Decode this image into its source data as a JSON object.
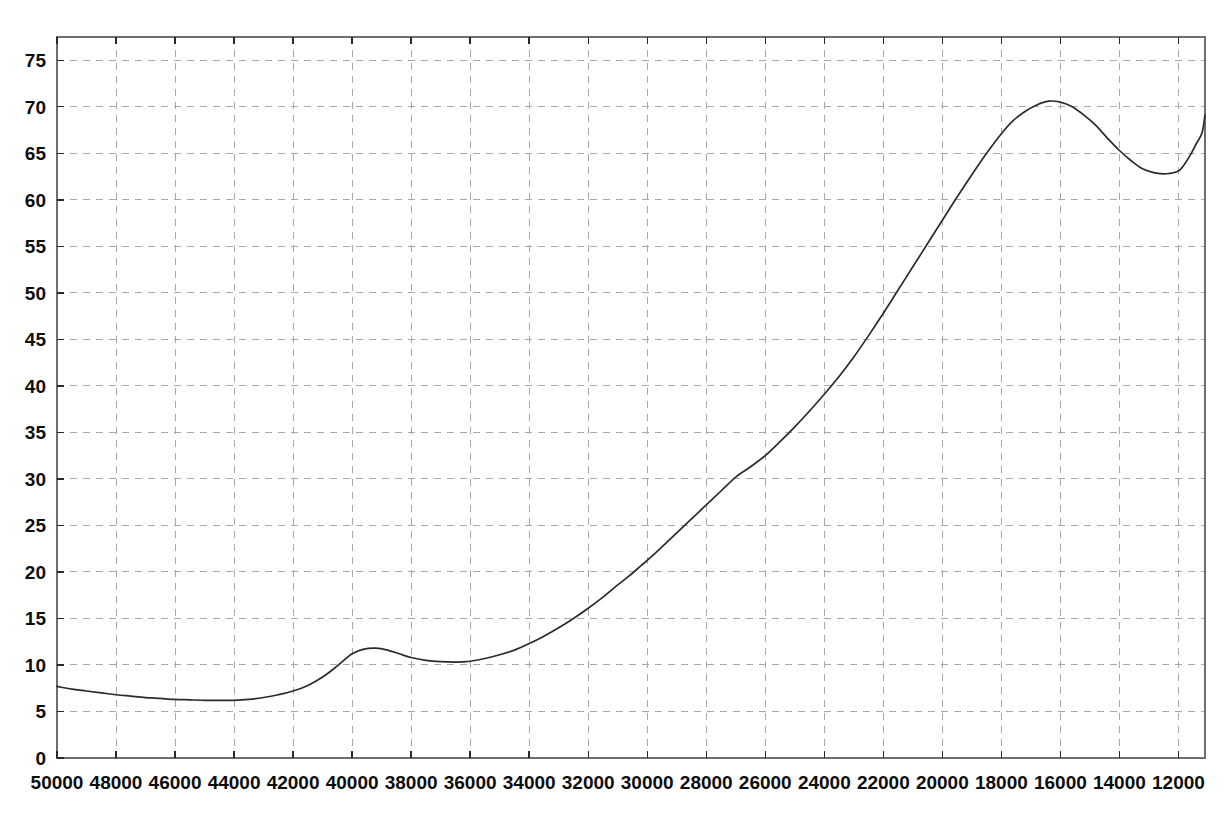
{
  "chart_data": {
    "type": "line",
    "title": "",
    "subtitle": "",
    "xlabel": "",
    "ylabel": "",
    "grid": true,
    "legend": "none",
    "x_axis_reversed": true,
    "xlim": [
      50000,
      11100
    ],
    "ylim": [
      0,
      77.5
    ],
    "x_ticks": [
      50000,
      48000,
      46000,
      44000,
      42000,
      40000,
      38000,
      36000,
      34000,
      32000,
      30000,
      28000,
      26000,
      24000,
      22000,
      20000,
      18000,
      16000,
      14000,
      12000
    ],
    "x_tick_labels": [
      "50000",
      "48000",
      "46000",
      "44000",
      "42000",
      "40000",
      "38000",
      "36000",
      "34000",
      "32000",
      "30000",
      "28000",
      "26000",
      "24000",
      "22000",
      "20000",
      "18000",
      "16000",
      "14000",
      "12000"
    ],
    "y_ticks": [
      0,
      5,
      10,
      15,
      20,
      25,
      30,
      35,
      40,
      45,
      50,
      55,
      60,
      65,
      70,
      75
    ],
    "y_tick_labels": [
      "0",
      "5",
      "10",
      "15",
      "20",
      "25",
      "30",
      "35",
      "40",
      "45",
      "50",
      "55",
      "60",
      "65",
      "70",
      "75"
    ],
    "line_color": "#2b2b2b",
    "grid_color": "#a8a8a8",
    "frame_color": "#6e6e6e",
    "background_color": "#ffffff",
    "series": [
      {
        "name": "curve",
        "x": [
          50000,
          49500,
          49000,
          48500,
          48000,
          47500,
          47000,
          46500,
          46000,
          45500,
          45000,
          44500,
          44000,
          43500,
          43000,
          42500,
          42000,
          41500,
          41000,
          40500,
          40000,
          39600,
          39200,
          38800,
          38400,
          38000,
          37500,
          37000,
          36500,
          36000,
          35500,
          35000,
          34500,
          34000,
          33500,
          33000,
          32500,
          32000,
          31500,
          31000,
          30600,
          30200,
          29800,
          29400,
          29000,
          28500,
          28000,
          27500,
          27000,
          26500,
          26000,
          25500,
          25000,
          24500,
          24000,
          23500,
          23000,
          22500,
          22000,
          21500,
          21000,
          20500,
          20000,
          19500,
          19000,
          18500,
          18000,
          17600,
          17200,
          16800,
          16400,
          16000,
          15600,
          15200,
          14800,
          14400,
          14000,
          13600,
          13200,
          12800,
          12400,
          12000,
          11800,
          11600,
          11400,
          11200,
          11100
        ],
        "y": [
          7.7,
          7.4,
          7.2,
          7.0,
          6.8,
          6.65,
          6.5,
          6.4,
          6.3,
          6.25,
          6.2,
          6.2,
          6.2,
          6.3,
          6.5,
          6.8,
          7.2,
          7.8,
          8.7,
          9.9,
          11.2,
          11.7,
          11.8,
          11.6,
          11.2,
          10.8,
          10.5,
          10.35,
          10.3,
          10.4,
          10.7,
          11.1,
          11.6,
          12.3,
          13.1,
          14.0,
          15.0,
          16.1,
          17.3,
          18.6,
          19.6,
          20.7,
          21.8,
          23.0,
          24.2,
          25.7,
          27.2,
          28.7,
          30.2,
          31.3,
          32.5,
          34.0,
          35.6,
          37.3,
          39.1,
          41.0,
          43.1,
          45.4,
          47.8,
          50.3,
          52.8,
          55.3,
          57.8,
          60.3,
          62.7,
          65.0,
          67.1,
          68.5,
          69.5,
          70.2,
          70.6,
          70.5,
          70.0,
          69.1,
          68.0,
          66.6,
          65.3,
          64.2,
          63.3,
          62.9,
          62.8,
          63.1,
          63.8,
          64.8,
          66.0,
          67.2,
          69.1
        ]
      }
    ]
  },
  "axes": {
    "plot_left_px": 57,
    "plot_right_px": 1205,
    "plot_top_px": 37,
    "plot_bottom_px": 758
  }
}
